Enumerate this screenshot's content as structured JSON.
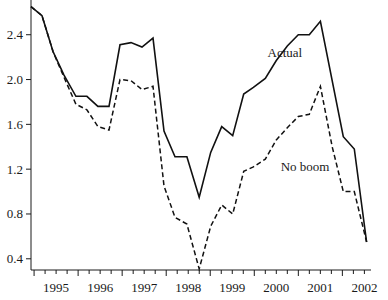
{
  "chart_data": {
    "type": "line",
    "title": "",
    "xlabel": "",
    "ylabel": "",
    "ylim": [
      0.3,
      2.71
    ],
    "xlim": [
      1994.93,
      2002.65
    ],
    "yticks": [
      0.4,
      0.8,
      1.2,
      1.6,
      2.0,
      2.4
    ],
    "ytick_labels": [
      "0.4",
      "0.8",
      "1.2",
      "1.6",
      "2.0",
      "2.4"
    ],
    "xtick_labels": [
      "1995",
      "1996",
      "1997",
      "1998",
      "1999",
      "2000",
      "2001",
      "2002"
    ],
    "xtick_label_positions": [
      1995.5,
      1996.5,
      1997.5,
      1998.5,
      1999.5,
      2000.5,
      2001.5,
      2002.5
    ],
    "major_ticks": [
      1995,
      1996,
      1997,
      1998,
      1999,
      2000,
      2001,
      2002
    ],
    "minor_tick_step": 0.25,
    "grid": false,
    "legend": "none",
    "annotations": [
      {
        "text": "Actual",
        "series": "Actual",
        "x": 2000.3,
        "y": 2.2
      },
      {
        "text": "No boom",
        "series": "No boom",
        "x": 2000.6,
        "y": 1.18
      }
    ],
    "series": [
      {
        "name": "Actual",
        "style": "solid",
        "x": [
          1994.93,
          1995.18,
          1995.43,
          1995.68,
          1995.95,
          1996.2,
          1996.45,
          1996.7,
          1996.95,
          1997.2,
          1997.45,
          1997.7,
          1997.95,
          1998.2,
          1998.47,
          1998.75,
          1999.01,
          1999.26,
          1999.51,
          1999.76,
          1999.98,
          2000.25,
          2000.5,
          2000.75,
          2001.0,
          2001.25,
          2001.5,
          2002.02,
          2002.27,
          2002.55
        ],
        "values": [
          2.65,
          2.57,
          2.25,
          2.04,
          1.85,
          1.85,
          1.76,
          1.76,
          2.31,
          2.33,
          2.29,
          2.37,
          1.54,
          1.31,
          1.31,
          0.95,
          1.35,
          1.58,
          1.5,
          1.87,
          1.93,
          2.01,
          2.17,
          2.3,
          2.4,
          2.4,
          2.52,
          1.49,
          1.38,
          0.55
        ]
      },
      {
        "name": "No boom",
        "style": "dashed",
        "x": [
          1994.93,
          1995.18,
          1995.43,
          1995.68,
          1995.95,
          1996.2,
          1996.45,
          1996.7,
          1996.95,
          1997.2,
          1997.45,
          1997.7,
          1997.95,
          1998.2,
          1998.47,
          1998.75,
          1999.01,
          1999.26,
          1999.51,
          1999.76,
          1999.98,
          2000.25,
          2000.5,
          2000.75,
          2001.0,
          2001.25,
          2001.5,
          2001.77,
          2002.02,
          2002.27,
          2002.55
        ],
        "values": [
          2.65,
          2.57,
          2.25,
          2.02,
          1.78,
          1.73,
          1.58,
          1.55,
          2.0,
          1.99,
          1.91,
          1.94,
          1.05,
          0.77,
          0.71,
          0.31,
          0.69,
          0.88,
          0.8,
          1.18,
          1.22,
          1.29,
          1.46,
          1.57,
          1.67,
          1.69,
          1.94,
          1.4,
          1.0,
          1.0,
          0.55
        ]
      }
    ]
  }
}
